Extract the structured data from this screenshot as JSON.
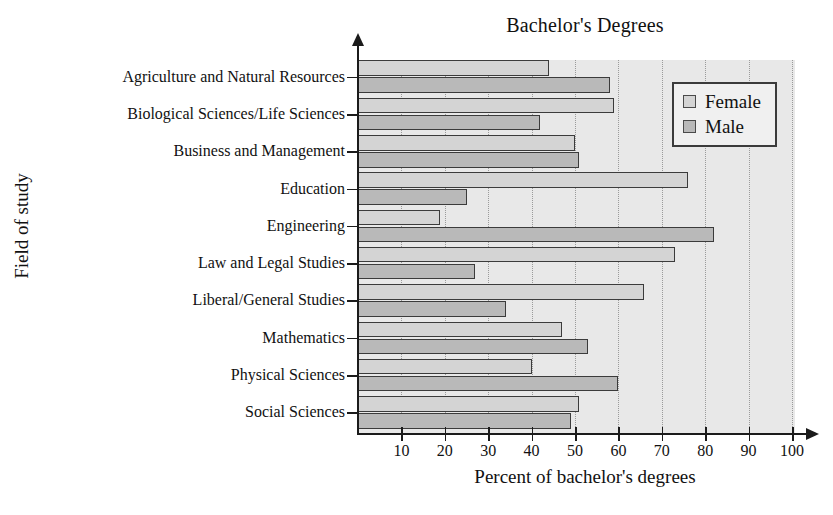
{
  "chart_data": {
    "type": "bar",
    "orientation": "horizontal",
    "title": "Bachelor's Degrees",
    "xlabel": "Percent of bachelor's degrees",
    "ylabel": "Field of study",
    "xlim": [
      0,
      100
    ],
    "xticks": [
      10,
      20,
      30,
      40,
      50,
      60,
      70,
      80,
      90,
      100
    ],
    "xtick_labels": [
      "10",
      "20",
      "30",
      "40",
      "50",
      "60",
      "70",
      "80",
      "90",
      "100"
    ],
    "grid": "vertical-dotted",
    "legend_position": "top-right",
    "categories": [
      "Agriculture and Natural Resources",
      "Biological Sciences/Life Sciences",
      "Business and Management",
      "Education",
      "Engineering",
      "Law and Legal Studies",
      "Liberal/General Studies",
      "Mathematics",
      "Physical Sciences",
      "Social Sciences"
    ],
    "series": [
      {
        "name": "Female",
        "color": "#d4d4d4",
        "values": [
          44,
          59,
          50,
          76,
          19,
          73,
          66,
          47,
          40,
          51
        ]
      },
      {
        "name": "Male",
        "color": "#b9b9b9",
        "values": [
          58,
          42,
          51,
          25,
          82,
          27,
          34,
          53,
          60,
          49
        ]
      }
    ]
  },
  "legend": {
    "items": [
      {
        "label": "Female",
        "swatch": "female"
      },
      {
        "label": "Male",
        "swatch": "male"
      }
    ]
  },
  "caption": {
    "remnant": ""
  }
}
